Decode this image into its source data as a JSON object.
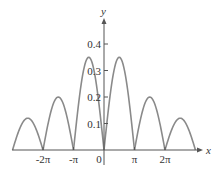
{
  "chart_data": {
    "type": "line",
    "title": "",
    "xlabel": "x",
    "ylabel": "y",
    "x_ticks": [
      "-2π",
      "-π",
      "0",
      "π",
      "2π"
    ],
    "y_ticks": [
      "0.1",
      "0.2",
      "0.3",
      "0.4"
    ],
    "xlim": [
      -9.42,
      9.42
    ],
    "ylim": [
      0,
      0.45
    ],
    "grid": false,
    "legend": null,
    "series": [
      {
        "name": "curve",
        "color": "#8a8a8a",
        "arches": [
          {
            "x_start": -9.42,
            "x_end": -6.28,
            "peak_x": -7.6,
            "peak_y": 0.12
          },
          {
            "x_start": -6.28,
            "x_end": -3.14,
            "peak_x": -4.5,
            "peak_y": 0.2
          },
          {
            "x_start": -3.14,
            "x_end": 0,
            "peak_x": -1.5,
            "peak_y": 0.35
          },
          {
            "x_start": 0,
            "x_end": 3.14,
            "peak_x": 1.5,
            "peak_y": 0.35
          },
          {
            "x_start": 3.14,
            "x_end": 6.28,
            "peak_x": 4.5,
            "peak_y": 0.2
          },
          {
            "x_start": 6.28,
            "x_end": 9.42,
            "peak_x": 7.6,
            "peak_y": 0.12
          }
        ]
      }
    ]
  }
}
